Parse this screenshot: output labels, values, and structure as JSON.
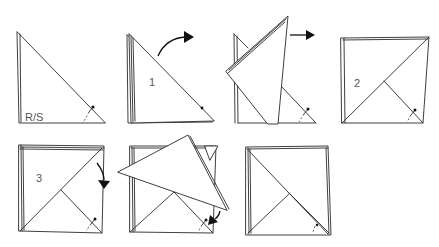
{
  "diagram": {
    "colors": {
      "stroke": "#2a2a2a",
      "background": "#ffffff",
      "label": "#555555",
      "arrow": "#111111"
    },
    "labels": {
      "fig1_side": "R/S",
      "fig2_step": "1",
      "fig4_step": "2",
      "fig5_step": "3"
    },
    "figures": [
      {
        "id": 1,
        "description": "Triangle, right side facing, pin at lower right"
      },
      {
        "id": 2,
        "description": "Stacked triangle with step 1 and curved arrow up-right"
      },
      {
        "id": 3,
        "description": "Top flap lifted with arrow pointing right"
      },
      {
        "id": 4,
        "description": "Square with diagonal fold, step 2"
      },
      {
        "id": 5,
        "description": "Square with diagonal fold, step 3 and curved arrow down"
      },
      {
        "id": 6,
        "description": "Flap folding down with arrow toward pin"
      },
      {
        "id": 7,
        "description": "Finished square with diagonal folds"
      }
    ]
  }
}
